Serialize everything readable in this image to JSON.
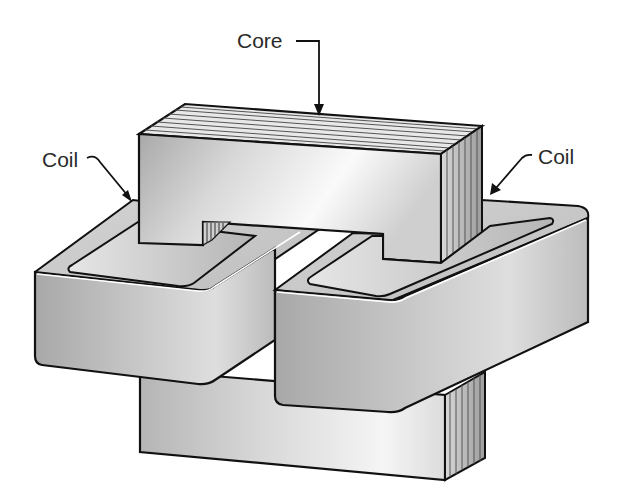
{
  "figure": {
    "labels": {
      "core": "Core",
      "coil_left": "Coil",
      "coil_right": "Coil"
    },
    "colors": {
      "outline": "#111111",
      "core_light": "#f4f4f4",
      "core_mid": "#c4c4c4",
      "core_dark": "#8e8e8e",
      "coil_light": "#e2e2e2",
      "coil_mid": "#bdbdbd",
      "coil_dark": "#9a9a9a",
      "text": "#2a2a2a"
    }
  }
}
